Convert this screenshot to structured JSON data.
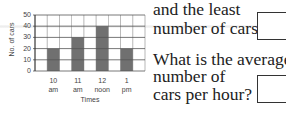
{
  "chart_data": {
    "type": "bar",
    "title": "",
    "categories": [
      "10 am",
      "11 am",
      "12 noon",
      "1 pm"
    ],
    "category_lines": [
      [
        "10",
        "am"
      ],
      [
        "11",
        "am"
      ],
      [
        "12",
        "noon"
      ],
      [
        "1",
        "pm"
      ]
    ],
    "values": [
      20,
      30,
      40,
      20
    ],
    "xlabel": "Times",
    "ylabel": "No. of cars",
    "yticks": [
      "0",
      "10",
      "20",
      "30",
      "40",
      "50"
    ],
    "ylim": [
      0,
      50
    ],
    "grid": true,
    "bar_color": "#707070",
    "grid_color": "#555555"
  },
  "questions": {
    "q1_line1": "and the least",
    "q1_line2": "number of cars?",
    "q2_line1": "What is the average",
    "q2_line2": "number of",
    "q2_line3": "cars per hour?"
  }
}
